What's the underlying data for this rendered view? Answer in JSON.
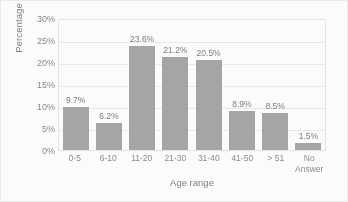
{
  "chart_data": {
    "type": "bar",
    "title": "",
    "categories": [
      "0-5",
      "6-10",
      "11-20",
      "21-30",
      "31-40",
      "41-50",
      "> 51",
      "No\nAnswer"
    ],
    "values": [
      9.7,
      6.2,
      23.6,
      21.2,
      20.5,
      8.9,
      8.5,
      1.5
    ],
    "data_labels": [
      "9.7%",
      "6.2%",
      "23.6%",
      "21.2%",
      "20.5%",
      "8.9%",
      "8.5%",
      "1.5%"
    ],
    "xlabel": "Age range",
    "ylabel": "Percentage",
    "ylim": [
      0,
      30
    ],
    "ytick_labels": [
      "30%",
      "25%",
      "20%",
      "15%",
      "10%",
      "5%",
      "0%"
    ],
    "ytick_values": [
      30,
      25,
      20,
      15,
      10,
      5,
      0
    ],
    "grid": true,
    "legend": false,
    "bar_color": "#a6a6a6",
    "gridline_color": "#ececec",
    "text_color": "#8a8a8a"
  }
}
